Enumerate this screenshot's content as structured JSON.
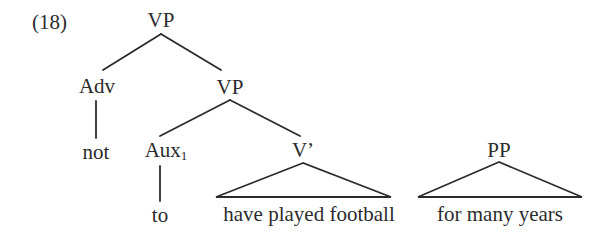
{
  "example_number": "(18)",
  "tree": {
    "root": {
      "label": "VP"
    },
    "adv": {
      "label": "Adv",
      "child": "not"
    },
    "vp2": {
      "label": "VP"
    },
    "aux": {
      "label": "Aux",
      "subscript": "1",
      "child": "to"
    },
    "vbar": {
      "label": "V’",
      "child_triangle": "have played football"
    },
    "pp": {
      "label": "PP",
      "child_triangle": "for many years"
    }
  },
  "colors": {
    "ink": "#2b2b2b",
    "background": "#ffffff"
  }
}
